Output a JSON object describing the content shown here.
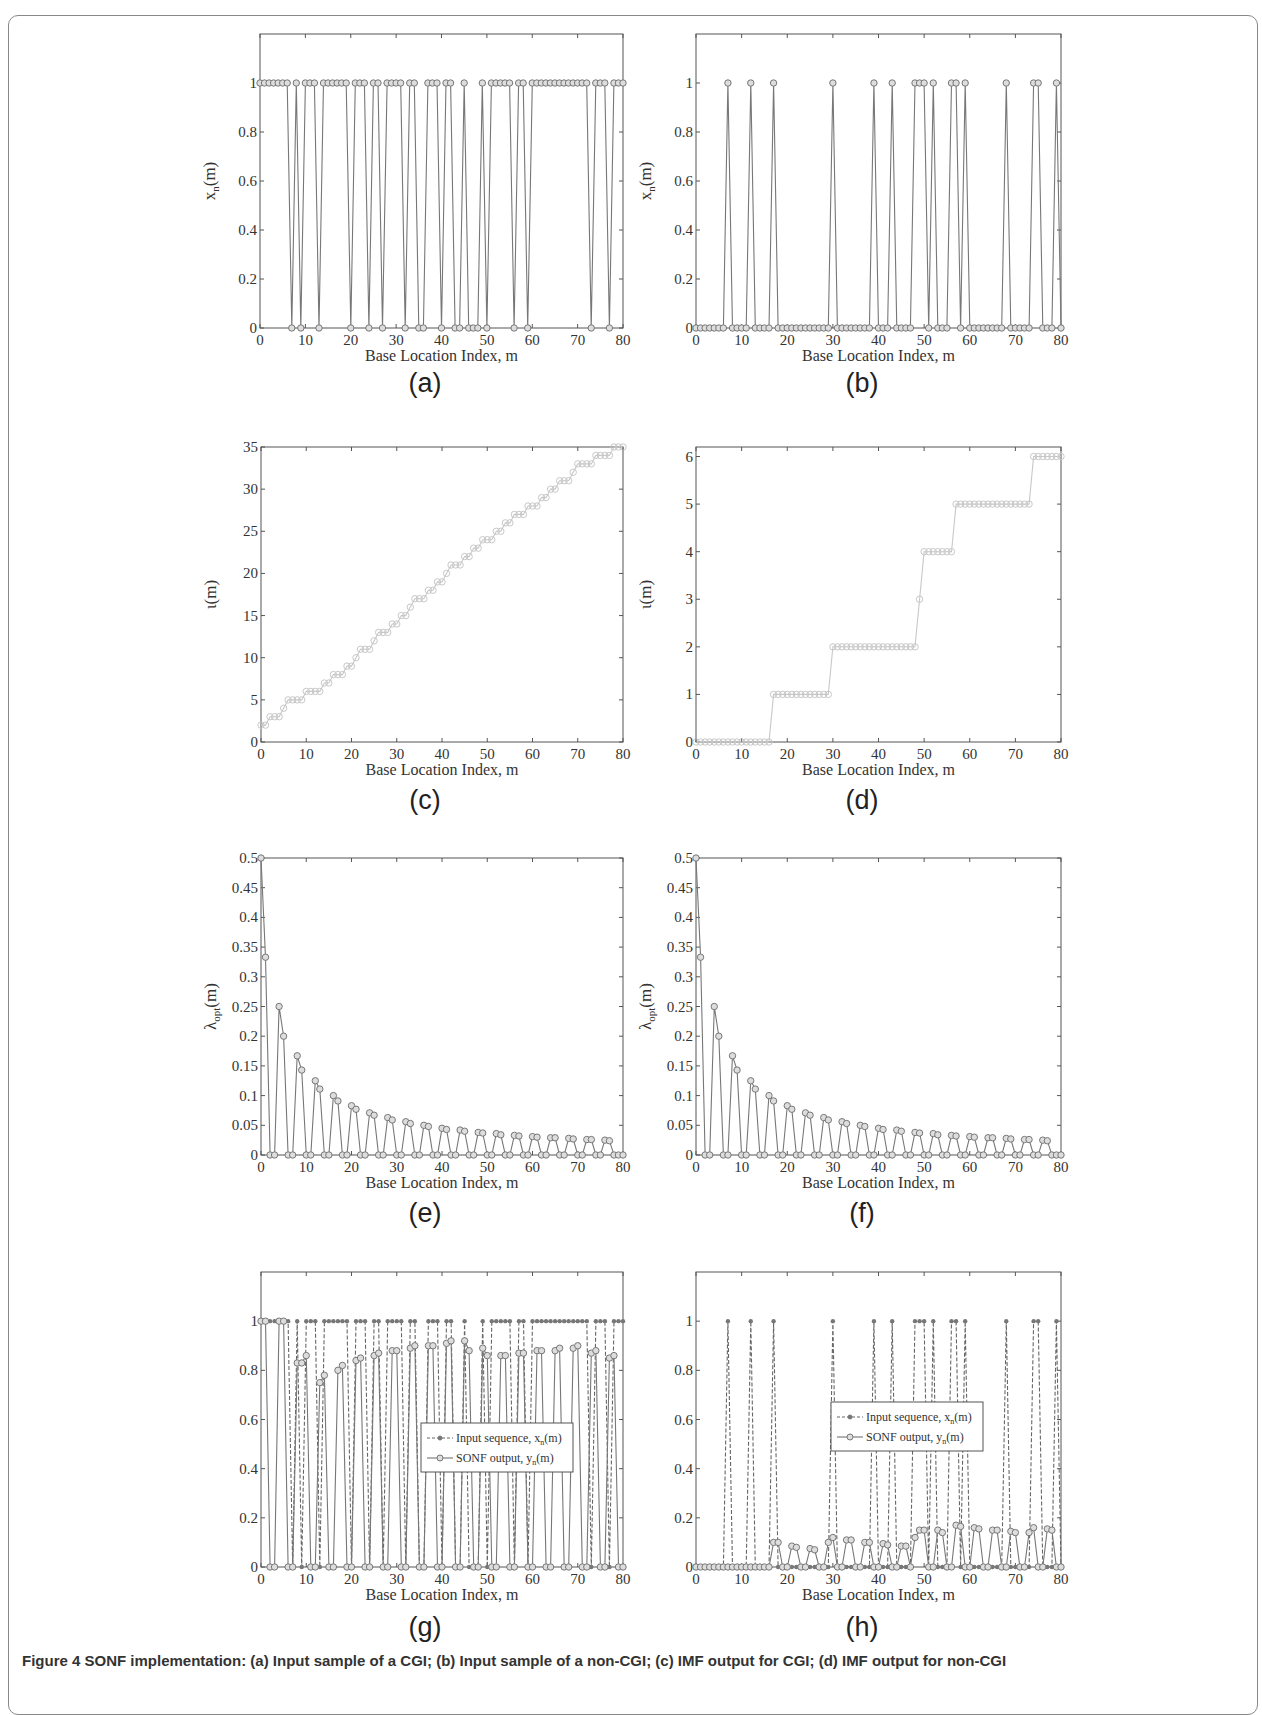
{
  "figure": {
    "caption_partial": "Figure 4 SONF implementation: (a) Input sample of a CGI; (b) Input sample of a non-CGI; (c) IMF output for CGI; (d) IMF output for non-CGI",
    "xlabel": "Base Location Index, m",
    "panels": [
      "(a)",
      "(b)",
      "(c)",
      "(d)",
      "(e)",
      "(f)",
      "(g)",
      "(h)"
    ]
  },
  "chart_data": [
    {
      "id": "a",
      "type": "line",
      "sublabel": "(a)",
      "xlabel": "Base Location Index, m",
      "ylabel": "x_n(m)",
      "xlim": [
        0,
        80
      ],
      "ylim": [
        0,
        1.2
      ],
      "xticks": [
        0,
        10,
        20,
        30,
        40,
        50,
        60,
        70,
        80
      ],
      "yticks": [
        0,
        0.2,
        0.4,
        0.6,
        0.8,
        1
      ],
      "marker": "circle",
      "series": [
        {
          "name": "x_n(m)",
          "x": "0..80",
          "values": [
            1,
            1,
            1,
            1,
            1,
            1,
            1,
            0,
            1,
            0,
            1,
            1,
            1,
            0,
            1,
            1,
            1,
            1,
            1,
            1,
            0,
            1,
            1,
            1,
            0,
            1,
            1,
            0,
            1,
            1,
            1,
            1,
            0,
            1,
            1,
            0,
            0,
            1,
            1,
            1,
            0,
            1,
            1,
            0,
            0,
            1,
            0,
            0,
            0,
            1,
            0,
            1,
            1,
            1,
            1,
            1,
            0,
            1,
            1,
            0,
            1,
            1,
            1,
            1,
            1,
            1,
            1,
            1,
            1,
            1,
            1,
            1,
            1,
            0,
            1,
            1,
            1,
            0,
            1,
            1,
            1
          ]
        }
      ]
    },
    {
      "id": "b",
      "type": "line",
      "sublabel": "(b)",
      "xlabel": "Base Location Index, m",
      "ylabel": "x_n(m)",
      "xlim": [
        0,
        80
      ],
      "ylim": [
        0,
        1.2
      ],
      "xticks": [
        0,
        10,
        20,
        30,
        40,
        50,
        60,
        70,
        80
      ],
      "yticks": [
        0,
        0.2,
        0.4,
        0.6,
        0.8,
        1
      ],
      "marker": "circle",
      "series": [
        {
          "name": "x_n(m)",
          "x": "0..80",
          "values": [
            0,
            0,
            0,
            0,
            0,
            0,
            0,
            1,
            0,
            0,
            0,
            0,
            1,
            0,
            0,
            0,
            0,
            1,
            0,
            0,
            0,
            0,
            0,
            0,
            0,
            0,
            0,
            0,
            0,
            0,
            1,
            0,
            0,
            0,
            0,
            0,
            0,
            0,
            0,
            1,
            0,
            0,
            0,
            1,
            0,
            0,
            0,
            0,
            1,
            1,
            1,
            0,
            1,
            0,
            0,
            0,
            1,
            1,
            0,
            1,
            0,
            0,
            0,
            0,
            0,
            0,
            0,
            0,
            1,
            0,
            0,
            0,
            0,
            0,
            1,
            1,
            0,
            0,
            0,
            1,
            0
          ]
        }
      ]
    },
    {
      "id": "c",
      "type": "line",
      "sublabel": "(c)",
      "xlabel": "Base Location Index, m",
      "ylabel": "ι(m)",
      "xlim": [
        0,
        80
      ],
      "ylim": [
        0,
        35
      ],
      "xticks": [
        0,
        10,
        20,
        30,
        40,
        50,
        60,
        70,
        80
      ],
      "yticks": [
        0,
        5,
        10,
        15,
        20,
        25,
        30,
        35
      ],
      "marker": "circle",
      "color": "#c8c8c8",
      "series": [
        {
          "name": "ι(m)",
          "x": "0..80",
          "values": [
            2,
            2,
            3,
            3,
            3,
            4,
            5,
            5,
            5,
            5,
            6,
            6,
            6,
            6,
            7,
            7,
            8,
            8,
            8,
            9,
            9,
            10,
            11,
            11,
            11,
            12,
            13,
            13,
            13,
            14,
            14,
            15,
            15,
            16,
            17,
            17,
            17,
            18,
            18,
            19,
            19,
            20,
            21,
            21,
            21,
            22,
            22,
            23,
            23,
            24,
            24,
            24,
            25,
            25,
            26,
            26,
            27,
            27,
            27,
            28,
            28,
            28,
            29,
            29,
            30,
            30,
            31,
            31,
            31,
            32,
            33,
            33,
            33,
            33,
            34,
            34,
            34,
            34,
            35,
            35,
            35
          ]
        }
      ]
    },
    {
      "id": "d",
      "type": "line",
      "sublabel": "(d)",
      "xlabel": "Base Location Index, m",
      "ylabel": "ι(m)",
      "xlim": [
        0,
        80
      ],
      "ylim": [
        0,
        6.2
      ],
      "xticks": [
        0,
        10,
        20,
        30,
        40,
        50,
        60,
        70,
        80
      ],
      "yticks": [
        0,
        1,
        2,
        3,
        4,
        5,
        6
      ],
      "marker": "circle",
      "color": "#c8c8c8",
      "series": [
        {
          "name": "ι(m)",
          "x": "0..80",
          "values": [
            0,
            0,
            0,
            0,
            0,
            0,
            0,
            0,
            0,
            0,
            0,
            0,
            0,
            0,
            0,
            0,
            0,
            1,
            1,
            1,
            1,
            1,
            1,
            1,
            1,
            1,
            1,
            1,
            1,
            1,
            2,
            2,
            2,
            2,
            2,
            2,
            2,
            2,
            2,
            2,
            2,
            2,
            2,
            2,
            2,
            2,
            2,
            2,
            2,
            3,
            4,
            4,
            4,
            4,
            4,
            4,
            4,
            5,
            5,
            5,
            5,
            5,
            5,
            5,
            5,
            5,
            5,
            5,
            5,
            5,
            5,
            5,
            5,
            5,
            6,
            6,
            6,
            6,
            6,
            6,
            6
          ]
        }
      ]
    },
    {
      "id": "e",
      "type": "line",
      "sublabel": "(e)",
      "xlabel": "Base Location Index, m",
      "ylabel": "λ_opt(m)",
      "xlim": [
        0,
        80
      ],
      "ylim": [
        0,
        0.5
      ],
      "xticks": [
        0,
        10,
        20,
        30,
        40,
        50,
        60,
        70,
        80
      ],
      "yticks": [
        0,
        0.05,
        0.1,
        0.15,
        0.2,
        0.25,
        0.3,
        0.35,
        0.4,
        0.45,
        0.5
      ],
      "marker": "circle",
      "series": [
        {
          "name": "λ_opt(m)",
          "x": "0..80",
          "values": [
            0.5,
            0.333,
            0,
            0,
            0.25,
            0.2,
            0,
            0,
            0.167,
            0.143,
            0,
            0,
            0.125,
            0.111,
            0,
            0,
            0.1,
            0.091,
            0,
            0,
            0.083,
            0.077,
            0,
            0,
            0.071,
            0.067,
            0,
            0,
            0.063,
            0.059,
            0,
            0,
            0.056,
            0.053,
            0,
            0,
            0.05,
            0.048,
            0,
            0,
            0.045,
            0.043,
            0,
            0,
            0.042,
            0.04,
            0,
            0,
            0.038,
            0.037,
            0,
            0,
            0.036,
            0.034,
            0,
            0,
            0.033,
            0.032,
            0,
            0,
            0.031,
            0.03,
            0,
            0,
            0.029,
            0.029,
            0,
            0,
            0.028,
            0.027,
            0,
            0,
            0.026,
            0.026,
            0,
            0,
            0.025,
            0.024,
            0,
            0,
            0
          ]
        }
      ]
    },
    {
      "id": "f",
      "type": "line",
      "sublabel": "(f)",
      "xlabel": "Base Location Index, m",
      "ylabel": "λ_opt(m)",
      "xlim": [
        0,
        80
      ],
      "ylim": [
        0,
        0.5
      ],
      "xticks": [
        0,
        10,
        20,
        30,
        40,
        50,
        60,
        70,
        80
      ],
      "yticks": [
        0,
        0.05,
        0.1,
        0.15,
        0.2,
        0.25,
        0.3,
        0.35,
        0.4,
        0.45,
        0.5
      ],
      "marker": "circle",
      "series": [
        {
          "name": "λ_opt(m)",
          "x": "0..80",
          "values": [
            0.5,
            0.333,
            0,
            0,
            0.25,
            0.2,
            0,
            0,
            0.167,
            0.143,
            0,
            0,
            0.125,
            0.111,
            0,
            0,
            0.1,
            0.091,
            0,
            0,
            0.083,
            0.077,
            0,
            0,
            0.071,
            0.067,
            0,
            0,
            0.063,
            0.059,
            0,
            0,
            0.056,
            0.053,
            0,
            0,
            0.05,
            0.048,
            0,
            0,
            0.045,
            0.043,
            0,
            0,
            0.042,
            0.04,
            0,
            0,
            0.038,
            0.037,
            0,
            0,
            0.036,
            0.034,
            0,
            0,
            0.033,
            0.032,
            0,
            0,
            0.031,
            0.03,
            0,
            0,
            0.029,
            0.029,
            0,
            0,
            0.028,
            0.027,
            0,
            0,
            0.026,
            0.026,
            0,
            0,
            0.025,
            0.024,
            0,
            0,
            0
          ]
        }
      ]
    },
    {
      "id": "g",
      "type": "line",
      "sublabel": "(g)",
      "xlabel": "Base Location Index, m",
      "ylabel": "",
      "xlim": [
        0,
        80
      ],
      "ylim": [
        0,
        1.2
      ],
      "xticks": [
        0,
        10,
        20,
        30,
        40,
        50,
        60,
        70,
        80
      ],
      "yticks": [
        0,
        0.2,
        0.4,
        0.6,
        0.8,
        1
      ],
      "legend": {
        "position": "center",
        "entries": [
          "Input sequence, x_n(m)",
          "SONF output, y_n(m)"
        ]
      },
      "series": [
        {
          "name": "Input sequence, x_n(m)",
          "style": "dashed",
          "marker": "dot",
          "x": "0..80",
          "values": [
            1,
            1,
            1,
            1,
            1,
            1,
            1,
            0,
            1,
            0,
            1,
            1,
            1,
            0,
            1,
            1,
            1,
            1,
            1,
            1,
            0,
            1,
            1,
            1,
            0,
            1,
            1,
            0,
            1,
            1,
            1,
            1,
            0,
            1,
            1,
            0,
            0,
            1,
            1,
            1,
            0,
            1,
            1,
            0,
            0,
            1,
            0,
            0,
            0,
            1,
            0,
            1,
            1,
            1,
            1,
            1,
            0,
            1,
            1,
            0,
            1,
            1,
            1,
            1,
            1,
            1,
            1,
            1,
            1,
            1,
            1,
            1,
            1,
            0,
            1,
            1,
            1,
            0,
            1,
            1,
            1
          ]
        },
        {
          "name": "SONF output, y_n(m)",
          "style": "solid",
          "marker": "circle",
          "x": "0..80",
          "values": [
            1,
            1,
            0,
            0,
            1,
            1,
            0,
            0,
            0.83,
            0.83,
            0.86,
            0,
            0,
            0.75,
            0.78,
            0,
            0,
            0.8,
            0.82,
            0,
            0,
            0.84,
            0.85,
            0,
            0,
            0.86,
            0.87,
            0,
            0,
            0.88,
            0.88,
            0,
            0,
            0.89,
            0.9,
            0,
            0,
            0.9,
            0.9,
            0,
            0,
            0.91,
            0.92,
            0,
            0,
            0.92,
            0.88,
            0,
            0,
            0.89,
            0.86,
            0,
            0,
            0.86,
            0.86,
            0,
            0,
            0.87,
            0.87,
            0,
            0,
            0.88,
            0.88,
            0,
            0,
            0.88,
            0.89,
            0,
            0,
            0.89,
            0.9,
            0,
            0,
            0.87,
            0.88,
            0,
            0,
            0.85,
            0.86,
            0,
            0
          ]
        }
      ]
    },
    {
      "id": "h",
      "type": "line",
      "sublabel": "(h)",
      "xlabel": "Base Location Index, m",
      "ylabel": "",
      "xlim": [
        0,
        80
      ],
      "ylim": [
        0,
        1.2
      ],
      "xticks": [
        0,
        10,
        20,
        30,
        40,
        50,
        60,
        70,
        80
      ],
      "yticks": [
        0,
        0.2,
        0.4,
        0.6,
        0.8,
        1
      ],
      "legend": {
        "position": "center",
        "entries": [
          "Input sequence, x_n(m)",
          "SONF output, y_n(m)"
        ]
      },
      "series": [
        {
          "name": "Input sequence, x_n(m)",
          "style": "dashed",
          "marker": "dot",
          "x": "0..80",
          "values": [
            0,
            0,
            0,
            0,
            0,
            0,
            0,
            1,
            0,
            0,
            0,
            0,
            1,
            0,
            0,
            0,
            0,
            1,
            0,
            0,
            0,
            0,
            0,
            0,
            0,
            0,
            0,
            0,
            0,
            0,
            1,
            0,
            0,
            0,
            0,
            0,
            0,
            0,
            0,
            1,
            0,
            0,
            0,
            1,
            0,
            0,
            0,
            0,
            1,
            1,
            1,
            0,
            1,
            0,
            0,
            0,
            1,
            1,
            0,
            1,
            0,
            0,
            0,
            0,
            0,
            0,
            0,
            0,
            1,
            0,
            0,
            0,
            0,
            0,
            1,
            1,
            0,
            0,
            0,
            1,
            0
          ]
        },
        {
          "name": "SONF output, y_n(m)",
          "style": "solid",
          "marker": "circle",
          "x": "0..80",
          "values": [
            0,
            0,
            0,
            0,
            0,
            0,
            0,
            0,
            0,
            0,
            0,
            0,
            0,
            0,
            0,
            0,
            0,
            0.1,
            0.1,
            0,
            0,
            0.085,
            0.08,
            0,
            0,
            0.075,
            0.07,
            0,
            0,
            0.1,
            0.12,
            0,
            0,
            0.11,
            0.11,
            0,
            0,
            0.1,
            0.1,
            0,
            0,
            0.095,
            0.09,
            0,
            0,
            0.085,
            0.085,
            0,
            0.12,
            0.15,
            0.15,
            0,
            0,
            0.15,
            0.14,
            0,
            0,
            0.17,
            0.165,
            0,
            0,
            0.16,
            0.155,
            0,
            0,
            0.15,
            0.15,
            0,
            0,
            0.145,
            0.14,
            0,
            0,
            0.14,
            0.16,
            0,
            0,
            0.155,
            0.15,
            0,
            0
          ]
        }
      ]
    }
  ]
}
